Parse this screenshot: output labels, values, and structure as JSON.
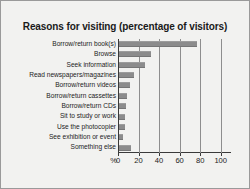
{
  "figure": {
    "background_color": "#f2f2f0",
    "border_color": "#9a9a9a",
    "bar_color": "#8c8c8c",
    "axis_color": "#3a3a3a",
    "grid_color": "#8e8e8e",
    "percent_symbol": "%"
  },
  "chart_data": {
    "type": "bar",
    "orientation": "horizontal",
    "title": "Reasons for visiting (percentage of visitors)",
    "xlabel": "%",
    "ylabel": "",
    "categories": [
      "Borrow/return book(s)",
      "Browse",
      "Seek information",
      "Read newspapers/magazines",
      "Borrow/return videos",
      "Borrow/return cassettes",
      "Borrow/return CDs",
      "Sit to study or work",
      "Use the photocopier",
      "See exhibition or event",
      "Something else"
    ],
    "values": [
      76,
      31,
      25,
      15,
      11,
      8,
      7,
      6,
      6,
      4,
      12
    ],
    "xlim": [
      0,
      110
    ],
    "xticks": [
      0,
      20,
      40,
      60,
      80,
      100
    ],
    "xticklabels": [
      "0",
      "20",
      "40",
      "60",
      "80",
      "100"
    ],
    "grid": true,
    "legend": false
  }
}
